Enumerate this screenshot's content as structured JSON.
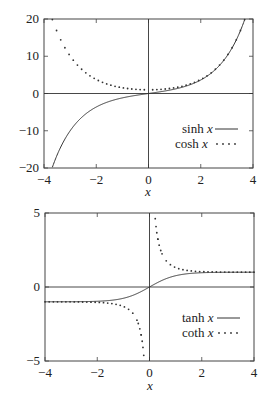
{
  "chart_data": [
    {
      "type": "line",
      "title": "",
      "xlabel": "x",
      "ylabel": "",
      "xlim": [
        -4,
        4
      ],
      "ylim": [
        -20,
        20
      ],
      "xticks": [
        -4,
        -2,
        0,
        2,
        4
      ],
      "yticks": [
        -20,
        -10,
        0,
        10,
        20
      ],
      "xtick_labels": [
        "−4",
        "−2",
        "0",
        "2",
        "4"
      ],
      "ytick_labels": [
        "−20",
        "−10",
        "0",
        "10",
        "20"
      ],
      "grid": false,
      "zero_axes": true,
      "legend_position": "lower right",
      "series": [
        {
          "name": "sinh",
          "label": "sinh",
          "var": "x",
          "style": "solid",
          "function": "sinh",
          "x": [
            -3.7,
            -3,
            -2,
            -1,
            0,
            1,
            2,
            3,
            3.7
          ],
          "values": [
            -20.2,
            -10.02,
            -3.63,
            -1.18,
            0,
            1.18,
            3.63,
            10.02,
            20.2
          ]
        },
        {
          "name": "cosh",
          "label": "cosh",
          "var": "x",
          "style": "dotted",
          "function": "cosh",
          "x": [
            -3.7,
            -3,
            -2,
            -1,
            0,
            1,
            2,
            3,
            3.7
          ],
          "values": [
            20.2,
            10.07,
            3.76,
            1.54,
            1,
            1.54,
            3.76,
            10.07,
            20.2
          ]
        }
      ]
    },
    {
      "type": "line",
      "title": "",
      "xlabel": "x",
      "ylabel": "",
      "xlim": [
        -4,
        4
      ],
      "ylim": [
        -5,
        5
      ],
      "xticks": [
        -4,
        -2,
        0,
        2,
        4
      ],
      "yticks": [
        -5,
        0,
        5
      ],
      "xtick_labels": [
        "−4",
        "−2",
        "0",
        "2",
        "4"
      ],
      "ytick_labels": [
        "−5",
        "0",
        "5"
      ],
      "grid": false,
      "zero_axes": true,
      "legend_position": "lower right",
      "series": [
        {
          "name": "tanh",
          "label": "tanh",
          "var": "x",
          "style": "solid",
          "function": "tanh",
          "x": [
            -4,
            -2,
            -1,
            0,
            1,
            2,
            4
          ],
          "values": [
            -1,
            -0.96,
            -0.76,
            0,
            0.76,
            0.96,
            1
          ]
        },
        {
          "name": "coth",
          "label": "coth",
          "var": "x",
          "style": "dotted",
          "function": "coth",
          "x": [
            -4,
            -2,
            -1,
            -0.5,
            -0.2,
            0.2,
            0.5,
            1,
            2,
            4
          ],
          "values": [
            -1,
            -1.04,
            -1.31,
            -2.16,
            -5.07,
            5.07,
            2.16,
            1.31,
            1.04,
            1
          ]
        }
      ]
    }
  ]
}
